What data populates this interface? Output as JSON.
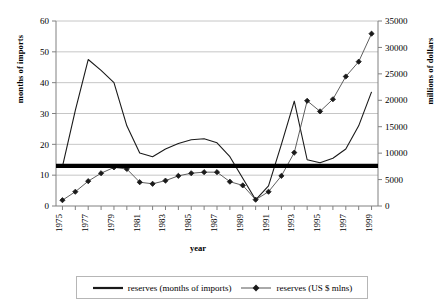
{
  "chart_data": {
    "type": "line",
    "title": "",
    "xlabel": "year",
    "ylabel": "months of imports",
    "ylabel_right": "millions of dollars",
    "grid": true,
    "legend_position": "bottom",
    "x": [
      1975,
      1976,
      1977,
      1978,
      1979,
      1980,
      1981,
      1982,
      1983,
      1984,
      1985,
      1986,
      1987,
      1988,
      1989,
      1990,
      1991,
      1992,
      1993,
      1994,
      1995,
      1996,
      1997,
      1998,
      1999
    ],
    "xticks": [
      "1975",
      "1976",
      "1977",
      "1978",
      "1979",
      "1980",
      "1981",
      "1982",
      "1983",
      "1984",
      "1985",
      "1986",
      "1987",
      "1988",
      "1989",
      "1990",
      "1991",
      "1992",
      "1993",
      "1994",
      "1995",
      "1996",
      "1997",
      "1998",
      "1999"
    ],
    "xtick_labels_shown": [
      "1975",
      "1977",
      "1979",
      "1981",
      "1983",
      "1985",
      "1987",
      "1989",
      "1991",
      "1993",
      "1995",
      "1997",
      "1999"
    ],
    "ylim": [
      0,
      60
    ],
    "yticks": [
      0,
      10,
      20,
      30,
      40,
      50,
      60
    ],
    "ytick_labels": [
      "0",
      "10",
      "20",
      "30",
      "40",
      "50",
      "60"
    ],
    "ylim_right": [
      0,
      35000
    ],
    "yticks_right": [
      0,
      5000,
      10000,
      15000,
      20000,
      25000,
      30000,
      35000
    ],
    "ytick_labels_right": [
      "0",
      "5000",
      "10000",
      "15000",
      "20000",
      "25000",
      "30000",
      "35000"
    ],
    "series": [
      {
        "name": "reserves (months of imports)",
        "axis": "left",
        "marker": "none",
        "color": "#1a1a1a",
        "values": [
          12.8,
          31.0,
          47.5,
          44.0,
          40.0,
          26.0,
          17.2,
          16.0,
          18.5,
          20.3,
          21.5,
          21.8,
          20.5,
          16.0,
          9.0,
          2.0,
          6.5,
          20.0,
          34.0,
          15.0,
          14.0,
          15.5,
          18.5,
          26.0,
          37.0
        ]
      },
      {
        "name": "reserves (US $ mlns)",
        "axis": "right",
        "marker": "diamond",
        "color": "#4d4d4d",
        "values": [
          1100,
          2700,
          4700,
          6200,
          7300,
          7000,
          4500,
          4200,
          4800,
          5700,
          6200,
          6400,
          6400,
          4600,
          3900,
          1200,
          2700,
          5700,
          10100,
          19900,
          17900,
          20200,
          24500,
          27300,
          32600
        ]
      }
    ],
    "annotations": [
      {
        "type": "hline",
        "axis": "left",
        "value": 13,
        "style": "thick-black",
        "label": ""
      }
    ]
  },
  "legend": {
    "items": [
      {
        "label": "reserves (months of imports)",
        "marker": "line",
        "color": "#1a1a1a"
      },
      {
        "label": "reserves (US $ mlns)",
        "marker": "line-diamond",
        "color": "#555555"
      }
    ]
  },
  "axes": {
    "x_title": "year",
    "y_title_left": "months of imports",
    "y_title_right": "millions of dollars"
  }
}
